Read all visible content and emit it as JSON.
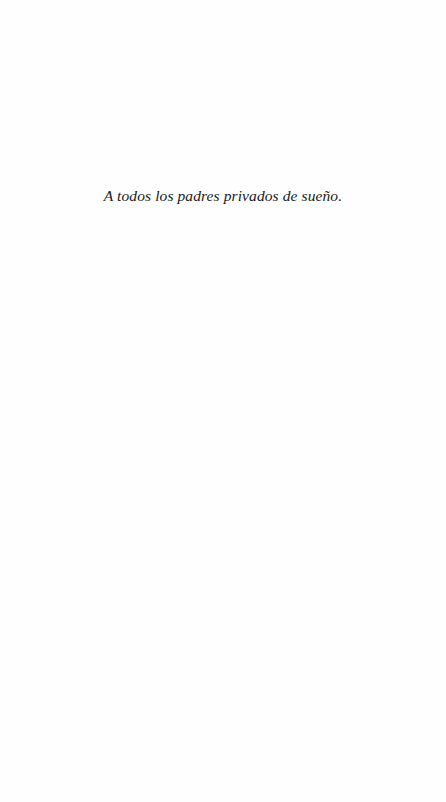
{
  "page": {
    "type": "dedication",
    "background": "#fefefe",
    "text_color": "#1a1a1a"
  },
  "dedication": {
    "text": "A todos los padres privados de sueño."
  }
}
